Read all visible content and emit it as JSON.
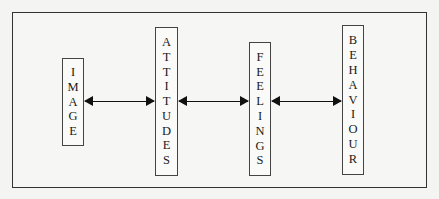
{
  "diagram": {
    "type": "flow",
    "nodes": [
      {
        "id": "image",
        "label": "IMAGE",
        "box": {
          "left": 62,
          "top": 58,
          "width": 22,
          "height": 88
        }
      },
      {
        "id": "attitudes",
        "label": "ATTITUDES",
        "box": {
          "left": 155,
          "top": 27,
          "width": 23,
          "height": 149
        }
      },
      {
        "id": "feelings",
        "label": "FEELINGS",
        "box": {
          "left": 249,
          "top": 42,
          "width": 22,
          "height": 134
        }
      },
      {
        "id": "behaviour",
        "label": "BEHAVIOUR",
        "box": {
          "left": 342,
          "top": 25,
          "width": 22,
          "height": 150
        }
      }
    ],
    "edges": [
      {
        "from": "image",
        "to": "attitudes",
        "direction": "bidirectional"
      },
      {
        "from": "attitudes",
        "to": "feelings",
        "direction": "bidirectional"
      },
      {
        "from": "feelings",
        "to": "behaviour",
        "direction": "bidirectional"
      }
    ],
    "colors": {
      "line": "#111111",
      "border": "#333333",
      "background": "#f4f4f2"
    }
  }
}
